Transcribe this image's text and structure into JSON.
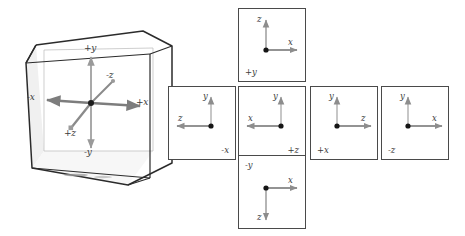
{
  "figure": {
    "background_color": "#ffffff"
  },
  "colors": {
    "cube_edge": "#2b2b2b",
    "cube_face_fill": "#f0f0f0",
    "axis_gray": "#8a8a8a",
    "axis_dark": "#6b6b6b",
    "label_text": "#3d3d3d",
    "face_border": "#4a4a4a"
  },
  "cube": {
    "name": "3d-cube-with-axes",
    "axes": [
      {
        "id": "plus-y",
        "label": "+y",
        "direction": "up",
        "color": "#9a9a9a"
      },
      {
        "id": "minus-y",
        "label": "-y",
        "direction": "down",
        "color": "#9a9a9a"
      },
      {
        "id": "plus-x",
        "label": "+x",
        "direction": "right",
        "color": "#7d7d7d"
      },
      {
        "id": "minus-x",
        "label": "-x",
        "direction": "left",
        "color": "#7d7d7d"
      },
      {
        "id": "plus-z",
        "label": "+z",
        "direction": "down-left",
        "color": "#8a8a8a"
      },
      {
        "id": "minus-z",
        "label": "-z",
        "direction": "up-right",
        "color": "#8a8a8a"
      }
    ]
  },
  "cubemap": {
    "name": "unfolded-cube-map",
    "layout": "cross",
    "faces": [
      {
        "id": "face-plus-y",
        "name": "+y",
        "position": "top",
        "name_corner": "bottom-left",
        "horizontal_axis": {
          "label": "x",
          "direction": "right"
        },
        "vertical_axis": {
          "label": "z",
          "direction": "up"
        }
      },
      {
        "id": "face-minus-x",
        "name": "-x",
        "position": "middle-1",
        "name_corner": "bottom-right",
        "horizontal_axis": {
          "label": "z",
          "direction": "left"
        },
        "vertical_axis": {
          "label": "y",
          "direction": "up"
        }
      },
      {
        "id": "face-plus-z",
        "name": "+z",
        "position": "middle-2",
        "name_corner": "bottom-right",
        "horizontal_axis": {
          "label": "x",
          "direction": "left"
        },
        "vertical_axis": {
          "label": "y",
          "direction": "up"
        }
      },
      {
        "id": "face-plus-x",
        "name": "+x",
        "position": "middle-3",
        "name_corner": "bottom-left",
        "horizontal_axis": {
          "label": "z",
          "direction": "right"
        },
        "vertical_axis": {
          "label": "y",
          "direction": "up"
        }
      },
      {
        "id": "face-minus-z",
        "name": "-z",
        "position": "middle-4",
        "name_corner": "bottom-left",
        "horizontal_axis": {
          "label": "x",
          "direction": "right"
        },
        "vertical_axis": {
          "label": "y",
          "direction": "up"
        }
      },
      {
        "id": "face-minus-y",
        "name": "-y",
        "position": "bottom",
        "name_corner": "top-left",
        "horizontal_axis": {
          "label": "x",
          "direction": "right"
        },
        "vertical_axis": {
          "label": "z",
          "direction": "down"
        }
      }
    ]
  }
}
